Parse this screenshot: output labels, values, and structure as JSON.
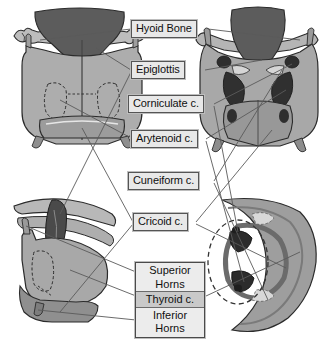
{
  "figure": {
    "background_color": "#ffffff",
    "views": [
      {
        "name": "anterior-view",
        "position": "top-left"
      },
      {
        "name": "posterior-view",
        "position": "top-right"
      },
      {
        "name": "lateral-view",
        "position": "bottom-left"
      },
      {
        "name": "superior-view",
        "position": "bottom-right"
      }
    ],
    "palette": {
      "cartilage_light": "#bdbdbd",
      "cartilage_mid": "#a3a3a3",
      "cartilage_dark": "#6e6e6e",
      "cartilage_darkest": "#3c3c3c",
      "outline": "#2b2b2b",
      "leader_line": "#5a5a5a",
      "label_fill": "#e8e8e8",
      "label_border": "#555555",
      "label_text": "#101010",
      "highlight_dash": "#333333"
    }
  },
  "labels": {
    "hyoid_bone": "Hyoid Bone",
    "epiglottis": "Epiglottis",
    "corniculate": "Corniculate c.",
    "arytenoid": "Arytenoid c.",
    "cuneiform": "Cuneiform c.",
    "cricoid": "Cricoid c.",
    "superior_horns": "Superior",
    "superior_horns_2": "Horns",
    "thyroid": "Thyroid c.",
    "inferior_horns": "Inferior",
    "inferior_horns_2": "Horns"
  }
}
